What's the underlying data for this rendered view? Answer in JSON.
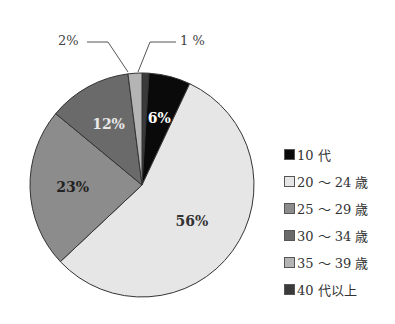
{
  "chart_data": {
    "type": "pie",
    "title": "",
    "categories": [
      "10代",
      "20～24歳",
      "25～29歳",
      "30～34歳",
      "35～39歳",
      "40代以上"
    ],
    "values": [
      6,
      56,
      23,
      12,
      2,
      1
    ],
    "labels": [
      "6%",
      "56%",
      "23%",
      "12%",
      "2%",
      "1 %"
    ],
    "colors": [
      "#0a0a0a",
      "#e6e6e6",
      "#8c8c8c",
      "#6a6a6a",
      "#b4b4b4",
      "#3a3a3a"
    ],
    "start_angle_deg": 0,
    "direction": "clockwise",
    "legend_position": "right"
  },
  "legend": [
    {
      "label": "10 代",
      "color": "#0a0a0a"
    },
    {
      "label": "20 ～ 24 歳",
      "color": "#e6e6e6"
    },
    {
      "label": "25 ～ 29 歳",
      "color": "#8c8c8c"
    },
    {
      "label": "30 ～ 34 歳",
      "color": "#6a6a6a"
    },
    {
      "label": "35 ～ 39 歳",
      "color": "#b4b4b4"
    },
    {
      "label": "40 代以上",
      "color": "#3a3a3a"
    }
  ],
  "callouts": {
    "left": "2%",
    "right": "1 %"
  }
}
